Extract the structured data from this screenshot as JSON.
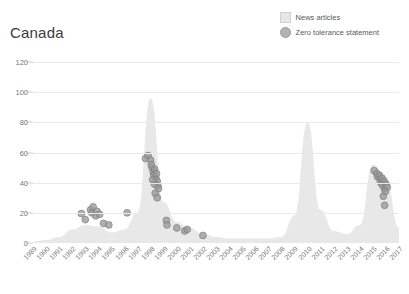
{
  "title": "Canada",
  "legend": {
    "position": "top-right",
    "items": [
      {
        "label": "News articles",
        "marker": "square-swatch-icon",
        "color": "#e6e6e6"
      },
      {
        "label": "Zero tolerance statement",
        "marker": "circle-swatch-icon",
        "color": "#b3b3b3"
      }
    ]
  },
  "axes": {
    "y_ticks": [
      "0",
      "20",
      "40",
      "60",
      "80",
      "100",
      "120"
    ],
    "x_ticks": [
      "1989",
      "1990",
      "1991",
      "1992",
      "1993",
      "1994",
      "1995",
      "1996",
      "1997",
      "1998",
      "1999",
      "2000",
      "2001",
      "2002",
      "2003",
      "2004",
      "2005",
      "2006",
      "2007",
      "2008",
      "2009",
      "2010",
      "2011",
      "2012",
      "2013",
      "2014",
      "2015",
      "2016",
      "2017"
    ]
  },
  "chart_data": {
    "type": "area",
    "title": "Canada",
    "xlabel": "",
    "ylabel": "",
    "ylim": [
      0,
      120
    ],
    "xlim": [
      1989,
      2017
    ],
    "grid": true,
    "legend_position": "top-right",
    "series": [
      {
        "name": "News articles",
        "type": "area",
        "color": "#e8e8e8",
        "x": [
          1989,
          1990,
          1991,
          1992,
          1993,
          1994,
          1995,
          1996,
          1997,
          1998,
          1999,
          2000,
          2001,
          2002,
          2003,
          2004,
          2005,
          2006,
          2007,
          2008,
          2009,
          2010,
          2011,
          2012,
          2013,
          2014,
          2015,
          2016,
          2017
        ],
        "values": [
          1,
          2,
          4,
          9,
          12,
          11,
          7,
          9,
          20,
          96,
          27,
          14,
          10,
          6,
          4,
          3,
          3,
          3,
          3,
          4,
          18,
          80,
          22,
          8,
          6,
          12,
          52,
          44,
          10
        ]
      },
      {
        "name": "Zero tolerance statement",
        "type": "scatter",
        "color": "#9a9a9a",
        "points": [
          {
            "x": 1992.7,
            "y": 19.5
          },
          {
            "x": 1993.0,
            "y": 15.5
          },
          {
            "x": 1993.4,
            "y": 22.0
          },
          {
            "x": 1993.5,
            "y": 20.0
          },
          {
            "x": 1993.6,
            "y": 24.0
          },
          {
            "x": 1993.8,
            "y": 18.0
          },
          {
            "x": 1993.9,
            "y": 21.0
          },
          {
            "x": 1994.1,
            "y": 19.0
          },
          {
            "x": 1994.4,
            "y": 13.0
          },
          {
            "x": 1994.8,
            "y": 12.0
          },
          {
            "x": 1996.2,
            "y": 20.0
          },
          {
            "x": 1997.6,
            "y": 56.0
          },
          {
            "x": 1997.8,
            "y": 58.0
          },
          {
            "x": 1998.0,
            "y": 55.0
          },
          {
            "x": 1998.1,
            "y": 50.0
          },
          {
            "x": 1998.2,
            "y": 47.0
          },
          {
            "x": 1998.25,
            "y": 45.0
          },
          {
            "x": 1998.3,
            "y": 49.0
          },
          {
            "x": 1998.4,
            "y": 43.0
          },
          {
            "x": 1998.45,
            "y": 46.0
          },
          {
            "x": 1998.5,
            "y": 41.0
          },
          {
            "x": 1998.55,
            "y": 38.0
          },
          {
            "x": 1998.6,
            "y": 36.0
          },
          {
            "x": 1998.3,
            "y": 39.0
          },
          {
            "x": 1998.15,
            "y": 42.0
          },
          {
            "x": 1998.05,
            "y": 52.0
          },
          {
            "x": 1998.35,
            "y": 33.0
          },
          {
            "x": 1998.5,
            "y": 30.0
          },
          {
            "x": 1999.2,
            "y": 15.0
          },
          {
            "x": 1999.25,
            "y": 12.0
          },
          {
            "x": 2000.0,
            "y": 10.0
          },
          {
            "x": 2000.6,
            "y": 8.0
          },
          {
            "x": 2000.8,
            "y": 9.0
          },
          {
            "x": 2002.0,
            "y": 5.0
          },
          {
            "x": 2015.1,
            "y": 48.0
          },
          {
            "x": 2015.3,
            "y": 46.0
          },
          {
            "x": 2015.35,
            "y": 44.0
          },
          {
            "x": 2015.5,
            "y": 45.0
          },
          {
            "x": 2015.55,
            "y": 42.0
          },
          {
            "x": 2015.6,
            "y": 40.0
          },
          {
            "x": 2015.7,
            "y": 43.0
          },
          {
            "x": 2015.75,
            "y": 38.0
          },
          {
            "x": 2015.85,
            "y": 41.0
          },
          {
            "x": 2015.9,
            "y": 36.0
          },
          {
            "x": 2016.0,
            "y": 39.0
          },
          {
            "x": 2016.1,
            "y": 37.0
          },
          {
            "x": 2015.95,
            "y": 34.0
          },
          {
            "x": 2015.8,
            "y": 31.0
          },
          {
            "x": 2015.9,
            "y": 25.0
          }
        ]
      }
    ]
  }
}
